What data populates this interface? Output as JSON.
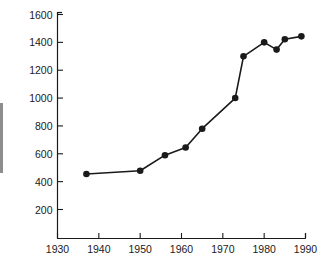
{
  "chart_data": {
    "type": "line",
    "title": "",
    "subtitle": "",
    "xlabel": "",
    "ylabel": "",
    "xlim": [
      1930,
      1990
    ],
    "ylim": [
      0,
      1600
    ],
    "xticks": [
      1930,
      1940,
      1950,
      1960,
      1970,
      1980,
      1990
    ],
    "xtick_labels": [
      "1930",
      "1940",
      "1950",
      "1960",
      "1970",
      "1980",
      "1990"
    ],
    "yticks": [
      200,
      400,
      600,
      800,
      1000,
      1200,
      1400,
      1600
    ],
    "ytick_labels": [
      "200",
      "400",
      "600",
      "800",
      "1000",
      "1200",
      "1400",
      "1600"
    ],
    "grid": false,
    "legend": null,
    "legend_position": "none",
    "annotations": [],
    "series": [
      {
        "name": "series-1",
        "color": "#1a1a1a",
        "marker": "circle",
        "x": [
          1937,
          1950,
          1956,
          1961,
          1965,
          1973,
          1975,
          1980,
          1983,
          1985,
          1989
        ],
        "values": [
          455,
          478,
          590,
          645,
          780,
          1000,
          1300,
          1400,
          1348,
          1422,
          1443
        ]
      }
    ]
  },
  "axes": {
    "x_axis_name": "x-axis",
    "y_axis_name": "y-axis",
    "axis_color": "#1a1a1a"
  },
  "colors": {
    "background": "#ffffff",
    "line": "#1a1a1a",
    "marker": "#1a1a1a",
    "axis": "#1a1a1a",
    "text": "#1a1a1a",
    "edge_mark": "#8d8d8d"
  }
}
